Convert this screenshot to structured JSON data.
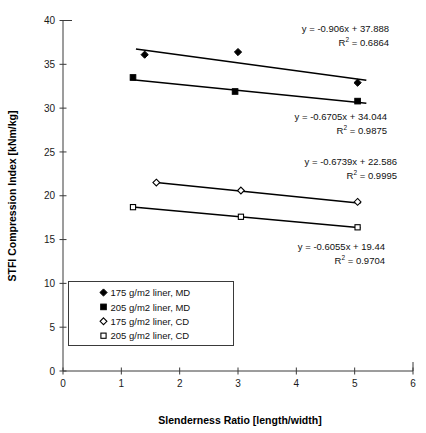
{
  "chart_data": {
    "type": "scatter",
    "title": "",
    "xlabel": "Slenderness Ratio [length/width]",
    "ylabel": "STFI Compression Index [kNm/kg]",
    "xlim": [
      0,
      6
    ],
    "ylim": [
      0,
      40
    ],
    "xticks": [
      0,
      1,
      2,
      3,
      4,
      5,
      6
    ],
    "yticks": [
      0,
      5,
      10,
      15,
      20,
      25,
      30,
      35,
      40
    ],
    "xtick_labels": [
      "0",
      "1",
      "2",
      "3",
      "4",
      "5",
      "6"
    ],
    "ytick_labels": [
      "0",
      "5",
      "10",
      "15",
      "20",
      "25",
      "30",
      "35",
      "40"
    ],
    "grid": false,
    "legend_position": "lower-left-inside",
    "series": [
      {
        "name": "175 g/m2 liner, MD",
        "marker": "filled-diamond",
        "x": [
          1.4,
          3.0,
          5.05
        ],
        "y": [
          36.1,
          36.4,
          32.9
        ],
        "fit_label": "y = -0.906x + 37.888",
        "fit_r2_label": "R² = 0.6864",
        "fit_slope": -0.906,
        "fit_intercept": 37.888,
        "fit_r2": 0.6864,
        "fit_x_range": [
          1.25,
          5.2
        ]
      },
      {
        "name": "205 g/m2 liner, MD",
        "marker": "filled-square",
        "x": [
          1.2,
          2.95,
          5.05
        ],
        "y": [
          33.5,
          31.9,
          30.8
        ],
        "fit_label": "y = -0.6705x + 34.044",
        "fit_r2_label": "R² = 0.9875",
        "fit_slope": -0.6705,
        "fit_intercept": 34.044,
        "fit_r2": 0.9875,
        "fit_x_range": [
          1.15,
          5.2
        ]
      },
      {
        "name": "175 g/m2 liner, CD",
        "marker": "open-diamond",
        "x": [
          1.6,
          3.05,
          5.05
        ],
        "y": [
          21.5,
          20.6,
          19.3
        ],
        "fit_label": "y = -0.6739x + 22.586",
        "fit_r2_label": "R² = 0.9995",
        "fit_slope": -0.6739,
        "fit_intercept": 22.586,
        "fit_r2": 0.9995,
        "fit_x_range": [
          1.6,
          5.1
        ]
      },
      {
        "name": "205 g/m2 liner, CD",
        "marker": "open-square",
        "x": [
          1.2,
          3.05,
          5.05
        ],
        "y": [
          18.7,
          17.6,
          16.4
        ],
        "fit_label": "y = -0.6055x + 19.44",
        "fit_r2_label": "R² = 0.9704",
        "fit_slope": -0.6055,
        "fit_intercept": 19.44,
        "fit_r2": 0.9704,
        "fit_x_range": [
          1.15,
          5.1
        ]
      }
    ],
    "annotations": [
      {
        "text": "y = -0.906x + 37.888",
        "x": 389,
        "y": 32,
        "anchor": "end"
      },
      {
        "text": "R² = 0.6864",
        "x": 389,
        "y": 46,
        "anchor": "end",
        "has_sup": true
      },
      {
        "text": "y = -0.6705x + 34.044",
        "x": 387,
        "y": 120,
        "anchor": "end"
      },
      {
        "text": "R² = 0.9875",
        "x": 387,
        "y": 134,
        "anchor": "end",
        "has_sup": true
      },
      {
        "text": "y = -0.6739x + 22.586",
        "x": 397,
        "y": 165,
        "anchor": "end"
      },
      {
        "text": "R² = 0.9995",
        "x": 397,
        "y": 179,
        "anchor": "end",
        "has_sup": true
      },
      {
        "text": "y = -0.6055x + 19.44",
        "x": 385,
        "y": 250,
        "anchor": "end"
      },
      {
        "text": "R² = 0.9704",
        "x": 385,
        "y": 264,
        "anchor": "end",
        "has_sup": true
      }
    ],
    "legend_entries": [
      {
        "marker": "filled-diamond",
        "label": "175 g/m2 liner, MD"
      },
      {
        "marker": "filled-square",
        "label": "205 g/m2 liner, MD"
      },
      {
        "marker": "open-diamond",
        "label": "175 g/m2 liner, CD"
      },
      {
        "marker": "open-square",
        "label": "205 g/m2 liner, CD"
      }
    ],
    "colors": {
      "line": "#000000",
      "marker": "#000000",
      "axis": "#3a3a3a",
      "text": "#111111",
      "background": "#ffffff"
    }
  }
}
